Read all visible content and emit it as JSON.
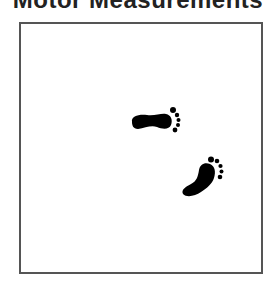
{
  "header": {
    "title": "Motor Measurements"
  },
  "canvas": {
    "border_color": "#555555",
    "background": "#ffffff"
  },
  "icons": [
    {
      "name": "footprint-icon",
      "color": "#000000",
      "orientation": "pointing-right"
    },
    {
      "name": "footprint-icon",
      "color": "#000000",
      "orientation": "pointing-up-right"
    }
  ]
}
